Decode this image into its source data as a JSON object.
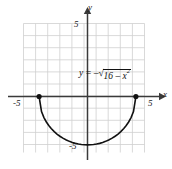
{
  "figure": {
    "name": "semicircle-graph",
    "background_color": "#ffffff"
  },
  "axes": {
    "x_axis_name": "x",
    "y_axis_name": "y",
    "x_tick_negative": "-5",
    "x_tick_positive": "5",
    "y_tick_positive": "5",
    "y_tick_negative": "-5",
    "axis_color": "#444444",
    "grid_color": "#cfcfcf"
  },
  "equation": {
    "lhs": "y",
    "equals": "=",
    "minus": "–",
    "radical": "√",
    "radicand_lead": "16 – ",
    "radicand_var": "x",
    "radicand_exponent": "2",
    "full_text": "y = -√(16 - x²)"
  },
  "chart_data": {
    "type": "line",
    "title": "",
    "subtitle": "",
    "xlabel": "x",
    "ylabel": "y",
    "equation": "y = -sqrt(16 - x^2)",
    "curve_color": "#111111",
    "curve_linewidth": 1.6,
    "endpoint_marker": "filled-circle",
    "endpoints": [
      {
        "x": -4,
        "y": 0
      },
      {
        "x": 4,
        "y": 0
      }
    ],
    "domain": [
      -4,
      4
    ],
    "range": [
      -4,
      0
    ],
    "radius": 4,
    "center": [
      0,
      0
    ],
    "xlim": [
      -6.25,
      5.5
    ],
    "ylim": [
      -6.1,
      5.6
    ],
    "grid": true,
    "grid_step": 1,
    "grid_x_range": [
      -5.25,
      5.25
    ],
    "grid_y_range": [
      -5.25,
      5.25
    ],
    "xticks_labeled": [
      -5,
      5
    ],
    "yticks_labeled": [
      -5,
      5
    ],
    "legend": "none",
    "annotations": [
      {
        "text": "y = -√(16 - x²)",
        "x": 0.6,
        "y": 1.4
      }
    ],
    "x": [
      -4,
      -3.8,
      -3.6,
      -3.4,
      -3.2,
      -3,
      -2.75,
      -2.5,
      -2.25,
      -2,
      -1.75,
      -1.5,
      -1.25,
      -1,
      -0.75,
      -0.5,
      -0.25,
      0,
      0.25,
      0.5,
      0.75,
      1,
      1.25,
      1.5,
      1.75,
      2,
      2.25,
      2.5,
      2.75,
      3,
      3.2,
      3.4,
      3.6,
      3.8,
      4
    ],
    "y": [
      0,
      -1.249,
      -1.744,
      -2.107,
      -2.4,
      -2.646,
      -2.905,
      -3.122,
      -3.307,
      -3.464,
      -3.597,
      -3.708,
      -3.8,
      -3.873,
      -3.929,
      -3.969,
      -3.992,
      -4,
      -3.992,
      -3.969,
      -3.929,
      -3.873,
      -3.8,
      -3.708,
      -3.597,
      -3.464,
      -3.307,
      -3.122,
      -2.905,
      -2.646,
      -2.4,
      -2.107,
      -1.744,
      -1.249,
      0
    ]
  }
}
